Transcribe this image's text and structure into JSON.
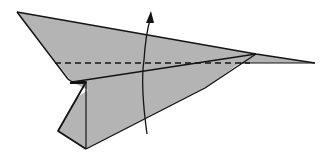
{
  "figure": {
    "kind": "origami-instruction-step",
    "instruction": "Fold the wing up along the dashed line",
    "colors": {
      "paper": "#b4b4b4",
      "paper_shadow": "#a8a8a8",
      "line": "#141414",
      "background": "#ffffff"
    },
    "elements": {
      "paper_airplane": "paper airplane body",
      "valley_fold_line": "dashed fold line",
      "fold_arrow": "curved arrow pointing up"
    }
  }
}
